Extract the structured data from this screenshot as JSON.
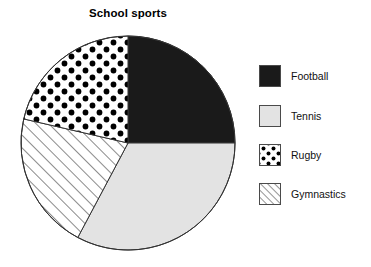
{
  "chart_data": {
    "type": "pie",
    "title": "School sports",
    "xlabel": "",
    "ylabel": "",
    "legend_position": "right",
    "grid": false,
    "start_angle_deg": 0,
    "direction": "clockwise",
    "categories": [
      "Football",
      "Tennis",
      "Rugby",
      "Gymnastics"
    ],
    "values": [
      25,
      33,
      21,
      21
    ],
    "units": "percent",
    "slices": [
      {
        "label": "Football",
        "value": 25,
        "start_angle_deg": 0,
        "end_angle_deg": 90,
        "fill": "solid-black",
        "color": "#1a1a1a"
      },
      {
        "label": "Tennis",
        "value": 33,
        "start_angle_deg": 90,
        "end_angle_deg": 208,
        "fill": "solid-light-gray",
        "color": "#e3e3e3"
      },
      {
        "label": "Gymnastics",
        "value": 21,
        "start_angle_deg": 208,
        "end_angle_deg": 283,
        "fill": "diagonal-hatch",
        "color": "#ffffff"
      },
      {
        "label": "Rugby",
        "value": 21,
        "start_angle_deg": 283,
        "end_angle_deg": 360,
        "fill": "polka-dots",
        "color": "#ffffff"
      }
    ],
    "geometry": {
      "center_x": 118,
      "center_y": 121,
      "radius": 107
    }
  },
  "legend": {
    "items": [
      {
        "label": "Football",
        "swatch": "solid-black-swatch"
      },
      {
        "label": "Tennis",
        "swatch": "light-gray-swatch"
      },
      {
        "label": "Rugby",
        "swatch": "dotted-swatch"
      },
      {
        "label": "Gymnastics",
        "swatch": "hatched-swatch"
      }
    ]
  },
  "colors": {
    "football": "#1a1a1a",
    "tennis": "#e3e3e3",
    "rugby_background": "#ffffff",
    "gymnastics_background": "#ffffff",
    "outline": "#333333",
    "text": "#111111",
    "page_background": "#ffffff"
  }
}
